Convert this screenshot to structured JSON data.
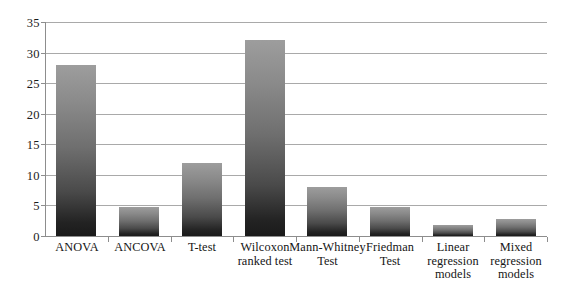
{
  "chart_data": {
    "type": "bar",
    "title": "",
    "subtitle": "",
    "xlabel": "",
    "ylabel": "",
    "ylim": [
      0,
      35
    ],
    "yticks": [
      0,
      5,
      10,
      15,
      20,
      25,
      30,
      35
    ],
    "ytick_labels": [
      "0",
      "5",
      "10",
      "15",
      "20",
      "25",
      "30",
      "35"
    ],
    "grid": true,
    "legend": false,
    "legend_position": "none",
    "categories": [
      "ANOVA",
      "ANCOVA",
      "T-test",
      "Wilcoxon ranked test",
      "Mann-Whitney Test",
      "Friedman Test",
      "Linear regression models",
      "Mixed regression models"
    ],
    "category_label_lines": [
      [
        "ANOVA"
      ],
      [
        "ANCOVA"
      ],
      [
        "T-test"
      ],
      [
        "Wilcoxon",
        "ranked test"
      ],
      [
        "Mann-Whitney",
        "Test"
      ],
      [
        "Friedman",
        "Test"
      ],
      [
        "Linear",
        "regression",
        "models"
      ],
      [
        "Mixed",
        "regression",
        "models"
      ]
    ],
    "values": [
      28,
      4.8,
      12,
      32,
      8,
      4.8,
      1.8,
      2.8
    ],
    "bar_gradient_top_color": "#9d9d9d",
    "bar_gradient_bottom_color": "#1a1a1a",
    "gridline_color": "#a9a9a9",
    "axis_color": "#8d8d8d",
    "background_color": "#ffffff"
  }
}
